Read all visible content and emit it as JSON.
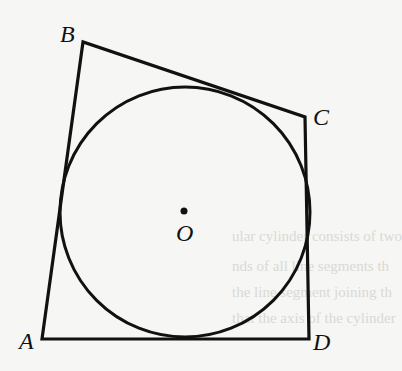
{
  "figure": {
    "stroke_color": "#111111",
    "background": "#f6f6f4",
    "vertices": {
      "A": {
        "label": "A",
        "x": 42,
        "y": 339
      },
      "B": {
        "label": "B",
        "x": 83,
        "y": 42
      },
      "C": {
        "label": "C",
        "x": 305,
        "y": 117
      },
      "D": {
        "label": "D",
        "x": 309,
        "y": 339
      }
    },
    "circle": {
      "cx": 185,
      "cy": 212,
      "r": 125
    },
    "center": {
      "label": "O",
      "x": 184,
      "y": 211
    }
  },
  "bleed_through_text": [
    "ular cylinder consists of two",
    "nds of all line segments th",
    "the line segment joining th",
    "that the axis of the cylinder",
    "is perpendicular to",
    "lar circular cylinder shown"
  ]
}
